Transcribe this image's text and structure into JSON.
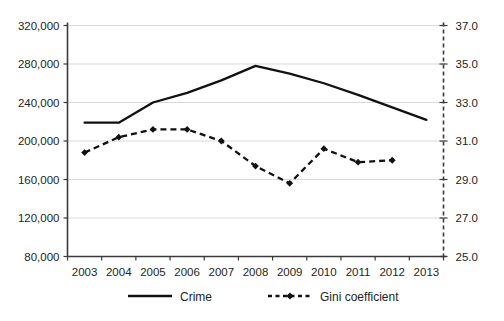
{
  "chart_data": {
    "type": "line",
    "title": "",
    "subtitle": "",
    "xlabel": "",
    "ylabel": "",
    "grid": true,
    "legend_position": "bottom",
    "categories": [
      "2003",
      "2004",
      "2005",
      "2006",
      "2007",
      "2008",
      "2009",
      "2010",
      "2011",
      "2012",
      "2013"
    ],
    "axes": {
      "left": {
        "label": "Crime",
        "min": 80000,
        "max": 320000,
        "step": 40000,
        "ticks": [
          "80,000",
          "120,000",
          "160,000",
          "200,000",
          "240,000",
          "280,000",
          "320,000"
        ],
        "tick_values": [
          80000,
          120000,
          160000,
          200000,
          240000,
          280000,
          320000
        ]
      },
      "right": {
        "label": "Gini coefficient",
        "min": 25.0,
        "max": 37.0,
        "step": 2.0,
        "ticks": [
          "25.0",
          "27.0",
          "29.0",
          "31.0",
          "33.0",
          "35.0",
          "37.0"
        ],
        "tick_values": [
          25.0,
          27.0,
          29.0,
          31.0,
          33.0,
          35.0,
          37.0
        ]
      }
    },
    "series": [
      {
        "name": "Crime",
        "axis": "left",
        "style": "solid",
        "marker": "none",
        "color": "#111111",
        "x": [
          "2003",
          "2004",
          "2005",
          "2006",
          "2007",
          "2008",
          "2009",
          "2010",
          "2011",
          "2012",
          "2013"
        ],
        "values": [
          219000,
          219000,
          240000,
          250000,
          263000,
          278000,
          270000,
          260000,
          248000,
          235000,
          222000
        ]
      },
      {
        "name": "Gini coefficient",
        "axis": "right",
        "style": "dashed",
        "marker": "diamond",
        "color": "#111111",
        "x": [
          "2003",
          "2004",
          "2005",
          "2006",
          "2007",
          "2008",
          "2009",
          "2010",
          "2011",
          "2012"
        ],
        "values": [
          30.4,
          31.2,
          31.6,
          31.6,
          31.0,
          29.7,
          28.8,
          30.6,
          29.9,
          30.0
        ]
      }
    ]
  },
  "legend": {
    "items": [
      {
        "label": "Crime",
        "style": "solid-line"
      },
      {
        "label": "Gini coefficient",
        "style": "dashed-line-diamond"
      }
    ]
  },
  "colors": {
    "series": "#111111",
    "gridline": "#d9d9d9",
    "axis": "#3a3a3a",
    "text": "#231f20",
    "background": "#ffffff"
  }
}
